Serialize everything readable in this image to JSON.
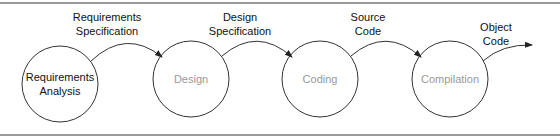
{
  "diagram": {
    "type": "process-flow",
    "colors": {
      "border": "#9a9a9a",
      "stroke": "#333333",
      "active_text": "#111111",
      "inactive_text": "#999999"
    },
    "nodes": [
      {
        "id": "requirements-analysis",
        "line1": "Requirements",
        "line2": "Analysis",
        "active": true
      },
      {
        "id": "design",
        "line1": "Design",
        "line2": "",
        "active": false
      },
      {
        "id": "coding",
        "line1": "Coding",
        "line2": "",
        "active": false
      },
      {
        "id": "compilation",
        "line1": "Compilation",
        "line2": "",
        "active": false
      }
    ],
    "edges": [
      {
        "from": "requirements-analysis",
        "to": "design",
        "line1": "Requirements",
        "line2": "Specification"
      },
      {
        "from": "design",
        "to": "coding",
        "line1": "Design",
        "line2": "Specification"
      },
      {
        "from": "coding",
        "to": "compilation",
        "line1": "Source",
        "line2": "Code"
      },
      {
        "from": "compilation",
        "to": "",
        "line1": "Object",
        "line2": "Code"
      }
    ]
  }
}
